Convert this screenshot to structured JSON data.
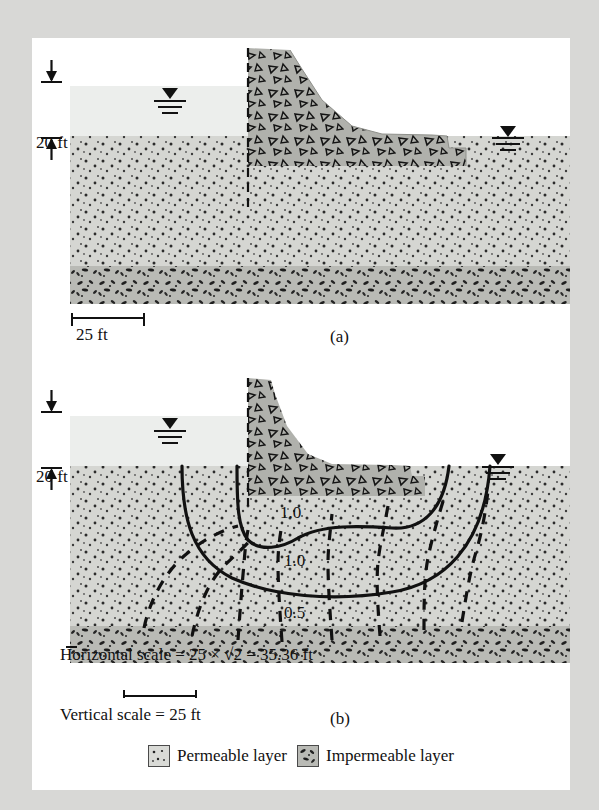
{
  "figure": {
    "type": "engineering-cross-section",
    "parts": [
      {
        "id": "a",
        "caption": "(a)",
        "description": "True-scale section of dam, permeable layer and impermeable layer",
        "head_label": "20 ft",
        "scale_label": "25 ft"
      },
      {
        "id": "b",
        "caption": "(b)",
        "description": "Transformed section with flow net drawn; flow lines solid, equipotential lines dashed",
        "head_label": "20 ft",
        "horizontal_scale_prefix": "Horizontal scale = 25",
        "horizontal_scale_times": "×",
        "horizontal_scale_radicand": "2",
        "horizontal_scale_result": "= 35.36 ft",
        "horizontal_scale_full": "Horizontal scale = 25 × √2 = 35.36 ft",
        "vertical_scale_label": "Vertical scale = 25 ft",
        "flownet_labels": [
          "1.0",
          "1.0",
          "0.5"
        ]
      }
    ],
    "legend": [
      {
        "key": "permeable",
        "label": "Permeable layer",
        "swatch": "light-dotted"
      },
      {
        "key": "impermeable",
        "label": "Impermeable layer",
        "swatch": "dark-blob"
      }
    ],
    "colors": {
      "page_background": "#d8d8d6",
      "panel": "#ffffff",
      "water": "#eceeec",
      "permeable_layer": "#d5d6d2",
      "impermeable_layer": "#b9bab5",
      "dam_concrete": "#b0b1ac",
      "ink": "#111111"
    },
    "annotations": {
      "water_table_symbol": "filled triangle over three lines",
      "sheet_pile": "vertical dashed line at upstream dam heel"
    }
  }
}
